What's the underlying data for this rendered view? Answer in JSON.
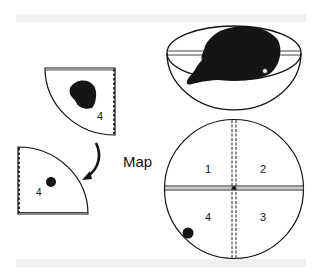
{
  "figure": {
    "map_label": "Map",
    "quadrant_labels": [
      "1",
      "2",
      "3",
      "4"
    ],
    "upper_wedge_label": "4",
    "lower_wedge_label": "4",
    "colors": {
      "ink": "#111111",
      "band": "#efefef",
      "background": "#ffffff"
    }
  }
}
